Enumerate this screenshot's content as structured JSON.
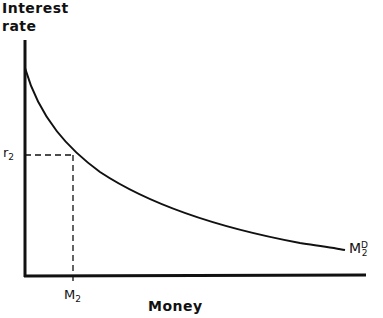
{
  "diagram": {
    "y_axis_title_line1": "Interest",
    "y_axis_title_line2": "rate",
    "x_axis_title": "Money",
    "r_label": "r",
    "r_sub": "2",
    "m_label": "M",
    "m_sub": "2",
    "curve_label": "M",
    "curve_sup": "D",
    "curve_sub": "2"
  }
}
